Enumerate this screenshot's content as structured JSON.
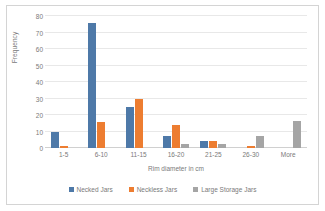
{
  "chart_data": {
    "type": "bar",
    "title": "",
    "xlabel": "Rim diameter in cm",
    "ylabel": "Frequency",
    "categories": [
      "1-5",
      "6-10",
      "11-15",
      "16-20",
      "21-25",
      "26-30",
      "More"
    ],
    "series": [
      {
        "name": "Necked Jars",
        "color": "#4E79A8",
        "values": [
          10,
          76,
          25,
          7,
          4.5,
          0,
          0
        ]
      },
      {
        "name": "Neckless Jars",
        "color": "#ED7D31",
        "values": [
          1,
          16,
          30,
          14,
          4.5,
          1.5,
          0
        ]
      },
      {
        "name": "Large Storage Jars",
        "color": "#A5A5A5",
        "values": [
          0,
          0,
          0,
          2.5,
          2.5,
          7,
          16.5
        ]
      }
    ],
    "ylim": [
      0,
      80
    ],
    "yticks": [
      0,
      10,
      20,
      30,
      40,
      50,
      60,
      70,
      80
    ],
    "grid": true,
    "legend_position": "bottom"
  }
}
